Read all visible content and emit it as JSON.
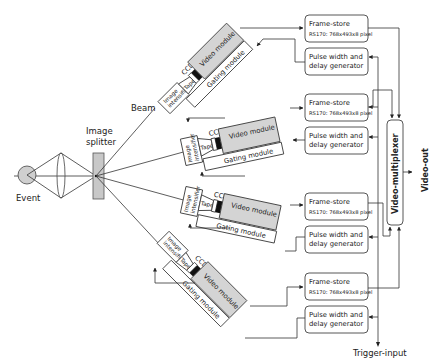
{
  "diagram": {
    "labels": {
      "event": "Event",
      "image_splitter_line1": "Image",
      "image_splitter_line2": "splitter",
      "beam": "Beam",
      "trigger_input": "Trigger-input",
      "video_out": "Video-out",
      "video_multiplexer": "Video-multiplexer"
    },
    "channels": [
      {
        "ccd": "CCD",
        "taper": "Taper",
        "intensifier_line1": "Image",
        "intensifier_line2": "intensifier",
        "video_module": "Video module",
        "gating_module": "Gating module",
        "frame_store_title": "Frame-store",
        "frame_store_spec": "RS170: 768x493x8 pixel",
        "pulse_line1": "Pulse width and",
        "pulse_line2": "delay generator"
      },
      {
        "ccd": "CCD",
        "taper": "Taper",
        "intensifier_line1": "Image",
        "intensifier_line2": "intensifier",
        "video_module": "Video module",
        "gating_module": "Gating module",
        "frame_store_title": "Frame-store",
        "frame_store_spec": "RS170: 768x493x8 pixel",
        "pulse_line1": "Pulse width and",
        "pulse_line2": "delay generator"
      },
      {
        "ccd": "CCD",
        "taper": "Taper",
        "intensifier_line1": "Image",
        "intensifier_line2": "intensifier",
        "video_module": "Video module",
        "gating_module": "Gating module",
        "frame_store_title": "Frame-store",
        "frame_store_spec": "RS170: 768x493x8 pixel",
        "pulse_line1": "Pulse width and",
        "pulse_line2": "delay generator"
      },
      {
        "ccd": "CCD",
        "taper": "Taper",
        "intensifier_line1": "Image",
        "intensifier_line2": "intensifier",
        "video_module": "Video module",
        "gating_module": "Gating module",
        "frame_store_title": "Frame-store",
        "frame_store_spec": "RS170: 768x493x8 pixel",
        "pulse_line1": "Pulse width and",
        "pulse_line2": "delay generator"
      }
    ],
    "colors": {
      "module_fill": "#d4d4d4",
      "ccd_fill": "#111111",
      "line": "#333333"
    }
  }
}
